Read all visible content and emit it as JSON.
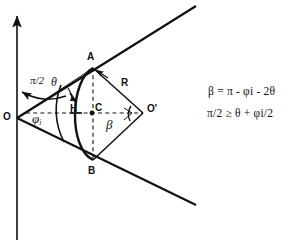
{
  "figure": {
    "title": "",
    "axis": {
      "name": "vertical-axis",
      "direction": "up"
    },
    "points": [
      {
        "id": "O",
        "label": "O",
        "x": 17,
        "y": 118
      },
      {
        "id": "A",
        "label": "A",
        "x": 93,
        "y": 68
      },
      {
        "id": "B",
        "label": "B",
        "x": 93,
        "y": 160
      },
      {
        "id": "C",
        "label": "C",
        "x": 92,
        "y": 113
      },
      {
        "id": "H",
        "label": "H",
        "x": 75,
        "y": 113
      },
      {
        "id": "Op",
        "label": "O'",
        "x": 143,
        "y": 113
      }
    ],
    "angle_labels": [
      {
        "id": "half-pi",
        "label": "π/2"
      },
      {
        "id": "theta",
        "label": "θ"
      },
      {
        "id": "phi-i",
        "label": "φ",
        "subscript": "i"
      },
      {
        "id": "beta",
        "label": "β"
      }
    ],
    "length_labels": [
      {
        "id": "R",
        "label": "R"
      }
    ],
    "equations": [
      {
        "id": "eq-beta",
        "text": "β = π - φi - 2θ"
      },
      {
        "id": "eq-constraint",
        "text": "π/2 ≥ θ + φi/2"
      }
    ],
    "colors": {
      "stroke": "#111111",
      "background": "#ffffff"
    }
  }
}
